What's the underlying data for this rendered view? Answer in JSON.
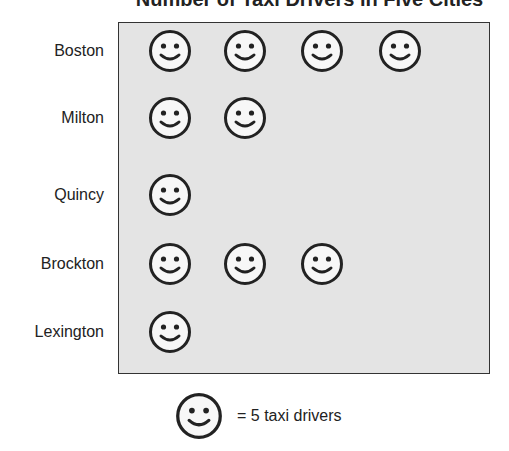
{
  "chart_data": {
    "type": "pictograph",
    "title": "Number of Taxi Drivers in Five Cities",
    "categories": [
      "Boston",
      "Milton",
      "Quincy",
      "Brockton",
      "Lexington"
    ],
    "icon_counts": [
      4,
      2,
      1,
      3,
      1
    ],
    "values": [
      20,
      10,
      5,
      15,
      5
    ],
    "icon": "smiley-face",
    "icon_value": 5,
    "legend": "= 5 taxi drivers",
    "xlabel": "",
    "ylabel": "",
    "grid": false
  },
  "title": "Number of Taxi Drivers in Five Cities",
  "rows": [
    {
      "label": "Boston",
      "count": 4
    },
    {
      "label": "Milton",
      "count": 2
    },
    {
      "label": "Quincy",
      "count": 1
    },
    {
      "label": "Brockton",
      "count": 3
    },
    {
      "label": "Lexington",
      "count": 1
    }
  ],
  "legend": {
    "text": "= 5 taxi drivers",
    "icon": "smiley-face-icon"
  },
  "colors": {
    "plot_bg": "#e4e4e4",
    "stroke": "#222222",
    "face": "#f7f7f7"
  }
}
